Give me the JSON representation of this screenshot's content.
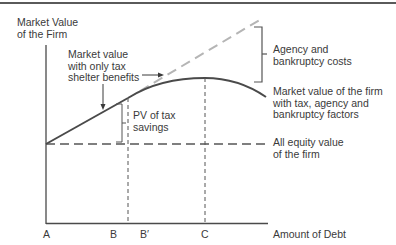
{
  "diagram": {
    "y_axis_label": [
      "Market Value",
      "of the Firm"
    ],
    "x_axis_label": "Amount of Debt",
    "x_ticks": [
      "A",
      "B",
      "B′",
      "C"
    ],
    "annotations": {
      "tax_shelter": [
        "Market value",
        "with only tax",
        "shelter benefits"
      ],
      "agency_costs": [
        "Agency and",
        "bankruptcy costs"
      ],
      "market_value_full": [
        "Market value of the firm",
        "with tax, agency and",
        "bankruptcy factors"
      ],
      "pv_tax_savings": [
        "PV of tax",
        "savings"
      ],
      "all_equity": [
        "All equity value",
        "of the firm"
      ]
    },
    "colors": {
      "main_curve": "#4a4a4a",
      "tax_shelter_dashed": "#b5b5b5",
      "axes": "#4a4a4a",
      "text": "#3a3a3a"
    }
  }
}
